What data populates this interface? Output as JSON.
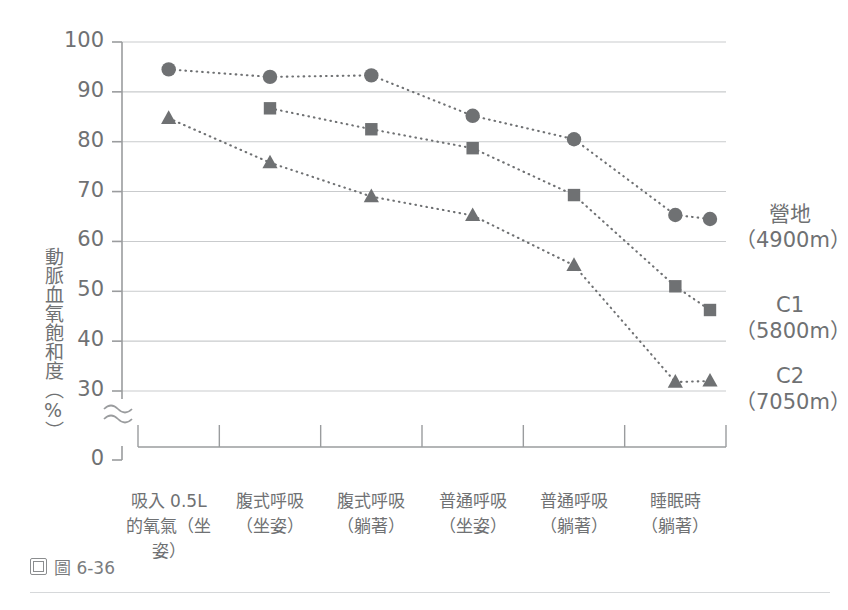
{
  "caption": {
    "icon": "figure-icon",
    "text": "圖 6-36"
  },
  "chart_data": {
    "type": "line",
    "title": "",
    "subtitle": "",
    "xlabel": "",
    "ylabel": "動脈血氧飽和度（%）",
    "ylim": [
      0,
      100
    ],
    "yticks": [
      0,
      30,
      40,
      50,
      60,
      70,
      80,
      90,
      100
    ],
    "axis_break": {
      "between": [
        0,
        30
      ],
      "symbol": "≈"
    },
    "grid": true,
    "grid_axis": "y",
    "legend_position": "right",
    "marker_color": "#6f7173",
    "line_style": "dotted",
    "categories": [
      "吸入 0.5L\n的氧氣（坐姿）",
      "腹式呼吸\n（坐姿）",
      "腹式呼吸\n（躺著）",
      "普通呼吸\n（坐姿）",
      "普通呼吸\n（躺著）",
      "睡眠時\n（躺著）"
    ],
    "categories_lines": [
      [
        "吸入 0.5L",
        "的氧氣（坐姿）"
      ],
      [
        "腹式呼吸",
        "（坐姿）"
      ],
      [
        "腹式呼吸",
        "（躺著）"
      ],
      [
        "普通呼吸",
        "（坐姿）"
      ],
      [
        "普通呼吸",
        "（躺著）"
      ],
      [
        "睡眠時",
        "（躺著）"
      ]
    ],
    "series": [
      {
        "name": "營地",
        "altitude": "（4900m）",
        "marker": "circle",
        "values": [
          94.5,
          93.0,
          93.3,
          85.2,
          80.5,
          65.3
        ]
      },
      {
        "name": "C1",
        "altitude": "（5800m）",
        "marker": "square",
        "values": [
          null,
          86.7,
          82.5,
          78.7,
          69.3,
          51.0
        ]
      },
      {
        "name": "C2",
        "altitude": "（7050m）",
        "marker": "triangle",
        "values": [
          84.7,
          75.8,
          69.0,
          65.2,
          55.2,
          31.8
        ]
      }
    ]
  }
}
